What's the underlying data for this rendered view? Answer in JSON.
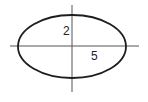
{
  "diagram": {
    "type": "ellipse-with-axes",
    "labels": {
      "semi_minor": "2",
      "semi_major": "5"
    },
    "semi_minor_axis": 2,
    "semi_major_axis": 5,
    "colors": {
      "ellipse": "#1e1e1e",
      "axes": "#555555",
      "text": "#222222",
      "background": "#ffffff"
    }
  }
}
